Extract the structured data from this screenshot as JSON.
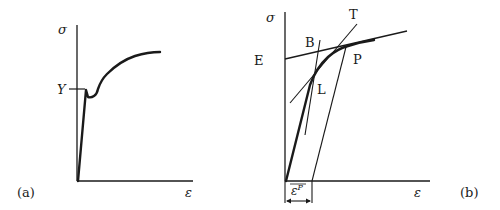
{
  "panels": [
    {
      "id": "a",
      "panel_label": "(a)",
      "y_axis_label": "σ",
      "x_axis_label": "ε",
      "yield_label": "Y",
      "description": "Stress-strain curve with upper and lower yield point"
    },
    {
      "id": "b",
      "panel_label": "(b)",
      "y_axis_label": "σ",
      "x_axis_label": "ε",
      "point_labels": {
        "E": "E",
        "B": "B",
        "T": "T",
        "P": "P",
        "L": "L"
      },
      "plastic_strain_label": "ε",
      "plastic_strain_superscript": "P",
      "description": "Stress-strain curve with unloading line and tangent constructions"
    }
  ],
  "colors": {
    "ink": "#1a1a1a",
    "background": "#ffffff"
  }
}
